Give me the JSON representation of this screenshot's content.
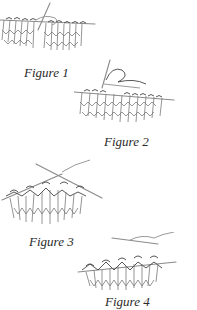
{
  "figures": [
    {
      "id": 1,
      "caption": "Figure 1",
      "depicts": "knitting stitches on needle, right needle inserted"
    },
    {
      "id": 2,
      "caption": "Figure 2",
      "depicts": "yarn wrapped around right needle"
    },
    {
      "id": 3,
      "caption": "Figure 3",
      "depicts": "right needle drawing loop through stitch"
    },
    {
      "id": 4,
      "caption": "Figure 4",
      "depicts": "completed stitch slipped onto right needle"
    }
  ],
  "colors": {
    "background": "#ffffff",
    "caption_text": "#2a2a2a",
    "line_art": "#7a7a7a"
  }
}
